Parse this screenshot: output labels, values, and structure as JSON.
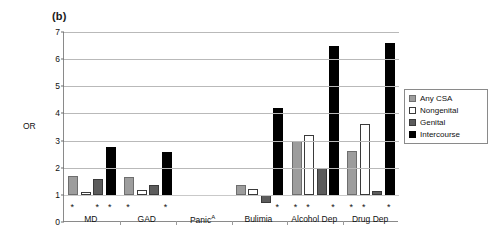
{
  "panel": {
    "label": "(b)"
  },
  "legend": {
    "position": "right",
    "entries": [
      {
        "label": "Any CSA",
        "key": "anycsa",
        "color": "#9d9d9d"
      },
      {
        "label": "Nongenital",
        "key": "nongenital",
        "color": "#ffffff"
      },
      {
        "label": "Genital",
        "key": "genital",
        "color": "#5c5c5c"
      },
      {
        "label": "Intercourse",
        "key": "intercourse",
        "color": "#000000"
      }
    ]
  },
  "chart_data": {
    "type": "bar",
    "title": "(b)",
    "xlabel": "",
    "ylabel": "OR",
    "ylim": [
      0,
      7
    ],
    "yticks": [
      0,
      1,
      2,
      3,
      4,
      5,
      6,
      7
    ],
    "grid": true,
    "reference_line": 1,
    "categories": [
      "MD",
      "GAD",
      "Panic",
      "Bulimia",
      "Alcohol Dep",
      "Drug Dep"
    ],
    "category_labels": [
      "MD",
      "GAD",
      "Panicᴬ",
      "Bulimia",
      "Alcohol Dep",
      "Drug Dep"
    ],
    "category_footnotes": {
      "Panic": "A"
    },
    "series": [
      {
        "name": "Any CSA",
        "values": [
          1.7,
          1.65,
          null,
          1.35,
          3.0,
          2.6
        ]
      },
      {
        "name": "Nongenital",
        "values": [
          1.1,
          1.18,
          null,
          1.2,
          3.2,
          3.6
        ]
      },
      {
        "name": "Genital",
        "values": [
          1.58,
          1.35,
          null,
          0.7,
          2.0,
          1.15
        ]
      },
      {
        "name": "Intercourse",
        "values": [
          2.78,
          2.58,
          null,
          4.2,
          6.5,
          6.6
        ]
      }
    ],
    "significance_markers": {
      "symbol": "*",
      "by_category": {
        "MD": [
          "Any CSA",
          "Genital",
          "Intercourse"
        ],
        "GAD": [
          "Any CSA",
          "Intercourse"
        ],
        "Panic": [],
        "Bulimia": [
          "Intercourse"
        ],
        "Alcohol Dep": [
          "Any CSA",
          "Nongenital",
          "Intercourse"
        ],
        "Drug Dep": [
          "Any CSA",
          "Nongenital",
          "Intercourse"
        ]
      }
    }
  }
}
